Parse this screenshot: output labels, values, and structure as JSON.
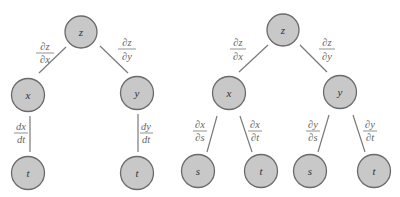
{
  "diagrams": [
    {
      "name": "tree-one-variable",
      "nodes": [
        {
          "id": "z",
          "label": "z",
          "cx": 81,
          "cy": 32
        },
        {
          "id": "x",
          "label": "x",
          "cx": 28,
          "cy": 95
        },
        {
          "id": "y",
          "label": "y",
          "cx": 137,
          "cy": 93
        },
        {
          "id": "t1",
          "label": "t",
          "cx": 28,
          "cy": 173
        },
        {
          "id": "t2",
          "label": "t",
          "cx": 137,
          "cy": 173
        }
      ],
      "edges": [
        {
          "from": "z",
          "to": "x",
          "num": "∂z",
          "den": "∂x"
        },
        {
          "from": "z",
          "to": "y",
          "num": "∂z",
          "den": "∂y"
        },
        {
          "from": "x",
          "to": "t1",
          "num": "dx",
          "den": "dt"
        },
        {
          "from": "y",
          "to": "t2",
          "num": "dy",
          "den": "dt"
        }
      ]
    },
    {
      "name": "tree-two-variables",
      "nodes": [
        {
          "id": "z",
          "label": "z",
          "cx": 283,
          "cy": 30
        },
        {
          "id": "x",
          "label": "x",
          "cx": 229,
          "cy": 93
        },
        {
          "id": "y",
          "label": "y",
          "cx": 340,
          "cy": 92
        },
        {
          "id": "s1",
          "label": "s",
          "cx": 198,
          "cy": 171
        },
        {
          "id": "t1",
          "label": "t",
          "cx": 261,
          "cy": 171
        },
        {
          "id": "s2",
          "label": "s",
          "cx": 310,
          "cy": 171
        },
        {
          "id": "t2",
          "label": "t",
          "cx": 374,
          "cy": 171
        }
      ],
      "edges": [
        {
          "from": "z",
          "to": "x",
          "num": "∂z",
          "den": "∂x"
        },
        {
          "from": "z",
          "to": "y",
          "num": "∂z",
          "den": "∂y"
        },
        {
          "from": "x",
          "to": "s1",
          "num": "∂x",
          "den": "∂s"
        },
        {
          "from": "x",
          "to": "t1",
          "num": "∂x",
          "den": "∂t"
        },
        {
          "from": "y",
          "to": "s2",
          "num": "∂y",
          "den": "∂s"
        },
        {
          "from": "y",
          "to": "t2",
          "num": "∂y",
          "den": "∂t"
        }
      ]
    }
  ],
  "node_radius": 16,
  "colors": {
    "node_fill": "#c8c8c8",
    "node_stroke": "#6a6a6a",
    "edge": "#7a7a7a",
    "label": "#666666"
  }
}
